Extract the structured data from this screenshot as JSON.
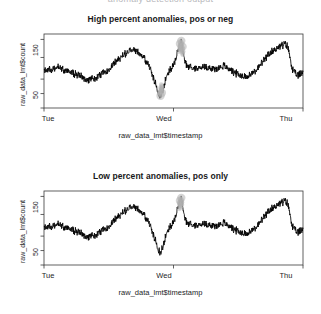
{
  "clipped_header": "anomaly detection output",
  "panels": [
    {
      "title": "High percent anomalies, pos or neg",
      "ylabel": "raw_data_lmt$count",
      "xlabel": "raw_data_lmt$timestamp",
      "yticks": [
        "150",
        "50"
      ],
      "xticks": [
        "Tue",
        "Wed",
        "Thu"
      ]
    },
    {
      "title": "Low percent anomalies, pos only",
      "ylabel": "raw_data_lmt$count",
      "xlabel": "raw_data_lmt$timestamp",
      "yticks": [
        "150",
        "50"
      ],
      "xticks": [
        "Tue",
        "Wed",
        "Thu"
      ]
    }
  ],
  "colors": {
    "line": "#000000",
    "anomaly_marker": "#b0b0b0",
    "axis": "#3a3a3a",
    "text": "#1d1d1f",
    "background": "#ffffff"
  },
  "chart_data": [
    {
      "type": "line",
      "title": "High percent anomalies, pos or neg",
      "xlabel": "raw_data_lmt$timestamp",
      "ylabel": "raw_data_lmt$count",
      "xticks": [
        "Tue",
        "Wed",
        "Thu"
      ],
      "xtick_positions": [
        0,
        0.5,
        1.0
      ],
      "yticks": [
        50,
        150
      ],
      "ylim": [
        10,
        215
      ],
      "grid": false,
      "legend": "none",
      "series": [
        {
          "name": "raw_data_lmt$count",
          "x": [
            0.0,
            0.01,
            0.02,
            0.03,
            0.04,
            0.05,
            0.06,
            0.07,
            0.08,
            0.09,
            0.1,
            0.11,
            0.12,
            0.13,
            0.14,
            0.15,
            0.16,
            0.17,
            0.18,
            0.19,
            0.2,
            0.21,
            0.22,
            0.23,
            0.24,
            0.25,
            0.26,
            0.27,
            0.28,
            0.29,
            0.3,
            0.31,
            0.32,
            0.33,
            0.34,
            0.35,
            0.36,
            0.37,
            0.38,
            0.39,
            0.4,
            0.41,
            0.42,
            0.43,
            0.44,
            0.45,
            0.46,
            0.47,
            0.48,
            0.49,
            0.5,
            0.51,
            0.52,
            0.53,
            0.54,
            0.55,
            0.56,
            0.57,
            0.58,
            0.59,
            0.6,
            0.61,
            0.62,
            0.63,
            0.64,
            0.65,
            0.66,
            0.67,
            0.68,
            0.69,
            0.7,
            0.71,
            0.72,
            0.73,
            0.74,
            0.75,
            0.76,
            0.77,
            0.78,
            0.79,
            0.8,
            0.81,
            0.82,
            0.83,
            0.84,
            0.85,
            0.86,
            0.87,
            0.88,
            0.89,
            0.9,
            0.91,
            0.92,
            0.93,
            0.94,
            0.95,
            0.96,
            0.97,
            0.98,
            0.99,
            1.0
          ],
          "values": [
            112,
            114,
            116,
            118,
            121,
            123,
            121,
            118,
            115,
            112,
            110,
            108,
            105,
            101,
            98,
            95,
            92,
            90,
            89,
            90,
            92,
            96,
            101,
            107,
            113,
            119,
            126,
            133,
            140,
            147,
            153,
            159,
            164,
            168,
            170,
            171,
            168,
            162,
            154,
            145,
            133,
            118,
            100,
            78,
            56,
            44,
            60,
            92,
            110,
            118,
            126,
            152,
            178,
            196,
            150,
            128,
            124,
            122,
            120,
            119,
            121,
            123,
            124,
            123,
            121,
            119,
            117,
            120,
            124,
            127,
            125,
            121,
            116,
            111,
            107,
            103,
            100,
            98,
            97,
            99,
            103,
            109,
            116,
            124,
            133,
            142,
            151,
            159,
            166,
            172,
            177,
            181,
            184,
            186,
            183,
            150,
            116,
            104,
            100,
            105,
            112
          ]
        }
      ],
      "anomalies": [
        {
          "x": 0.45,
          "y": 44,
          "type": "negative"
        },
        {
          "x": 0.455,
          "y": 52,
          "type": "negative"
        },
        {
          "x": 0.53,
          "y": 196,
          "type": "positive"
        },
        {
          "x": 0.525,
          "y": 188,
          "type": "positive"
        },
        {
          "x": 0.535,
          "y": 180,
          "type": "positive"
        }
      ],
      "anomaly_style": "grey semi-transparent dots overlaid on extreme points"
    },
    {
      "type": "line",
      "title": "Low percent anomalies, pos only",
      "xlabel": "raw_data_lmt$timestamp",
      "ylabel": "raw_data_lmt$count",
      "xticks": [
        "Tue",
        "Wed",
        "Thu"
      ],
      "xtick_positions": [
        0,
        0.5,
        1.0
      ],
      "yticks": [
        50,
        150
      ],
      "ylim": [
        10,
        215
      ],
      "grid": false,
      "legend": "none",
      "series": [
        {
          "name": "raw_data_lmt$count",
          "x": [
            0.0,
            0.01,
            0.02,
            0.03,
            0.04,
            0.05,
            0.06,
            0.07,
            0.08,
            0.09,
            0.1,
            0.11,
            0.12,
            0.13,
            0.14,
            0.15,
            0.16,
            0.17,
            0.18,
            0.19,
            0.2,
            0.21,
            0.22,
            0.23,
            0.24,
            0.25,
            0.26,
            0.27,
            0.28,
            0.29,
            0.3,
            0.31,
            0.32,
            0.33,
            0.34,
            0.35,
            0.36,
            0.37,
            0.38,
            0.39,
            0.4,
            0.41,
            0.42,
            0.43,
            0.44,
            0.45,
            0.46,
            0.47,
            0.48,
            0.49,
            0.5,
            0.51,
            0.52,
            0.53,
            0.54,
            0.55,
            0.56,
            0.57,
            0.58,
            0.59,
            0.6,
            0.61,
            0.62,
            0.63,
            0.64,
            0.65,
            0.66,
            0.67,
            0.68,
            0.69,
            0.7,
            0.71,
            0.72,
            0.73,
            0.74,
            0.75,
            0.76,
            0.77,
            0.78,
            0.79,
            0.8,
            0.81,
            0.82,
            0.83,
            0.84,
            0.85,
            0.86,
            0.87,
            0.88,
            0.89,
            0.9,
            0.91,
            0.92,
            0.93,
            0.94,
            0.95,
            0.96,
            0.97,
            0.98,
            0.99,
            1.0
          ],
          "values": [
            112,
            114,
            116,
            118,
            121,
            123,
            121,
            118,
            115,
            112,
            110,
            108,
            105,
            101,
            98,
            95,
            92,
            90,
            89,
            90,
            92,
            96,
            101,
            107,
            113,
            119,
            126,
            133,
            140,
            147,
            153,
            159,
            164,
            168,
            170,
            171,
            168,
            162,
            154,
            145,
            133,
            118,
            100,
            78,
            56,
            44,
            60,
            92,
            110,
            118,
            126,
            152,
            178,
            196,
            150,
            128,
            124,
            122,
            120,
            119,
            121,
            123,
            124,
            123,
            121,
            119,
            117,
            120,
            124,
            127,
            125,
            121,
            116,
            111,
            107,
            103,
            100,
            98,
            97,
            99,
            103,
            109,
            116,
            124,
            133,
            142,
            151,
            159,
            166,
            172,
            177,
            181,
            184,
            186,
            183,
            150,
            116,
            104,
            100,
            105,
            112
          ]
        }
      ],
      "anomalies": [
        {
          "x": 0.53,
          "y": 196,
          "type": "positive"
        },
        {
          "x": 0.525,
          "y": 188,
          "type": "positive"
        }
      ],
      "anomaly_style": "grey semi-transparent dots overlaid on positive extreme points only"
    }
  ]
}
